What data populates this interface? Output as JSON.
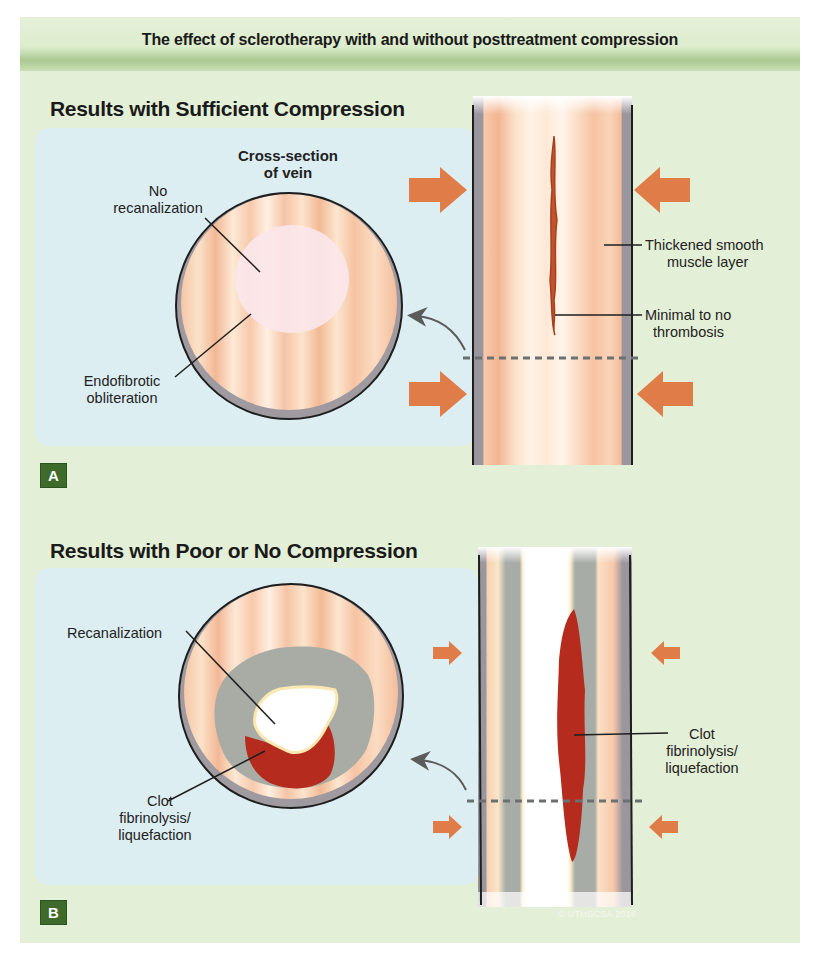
{
  "header": {
    "title": "The effect of sclerotherapy with and without posttreatment compression"
  },
  "colors": {
    "panel_bg": "#e4efd7",
    "header_band": "#a9c98f",
    "blue_box": "#ddeef2",
    "badge_bg": "#3e6b2c",
    "arrow": "#e07c48",
    "clot": "#b8291c",
    "vessel_wall": "#9e9aa0",
    "muscle_stripes": "#f4c3a3",
    "thrombus_gray": "#a7aca4"
  },
  "panels": [
    {
      "id": "A",
      "badge": "A",
      "title": "Results with Sufficient Compression",
      "cross_section_label": [
        "Cross-section",
        "of vein"
      ],
      "circle_labels": [
        {
          "name": "no-recanalization",
          "lines": [
            "No",
            "recanalization"
          ]
        },
        {
          "name": "endofibrotic-obliteration",
          "lines": [
            "Endofibrotic",
            "obliteration"
          ]
        }
      ],
      "vein_labels": [
        {
          "name": "thickened-smooth-muscle-layer",
          "lines": [
            "Thickened smooth",
            "muscle layer"
          ]
        },
        {
          "name": "minimal-thrombosis",
          "lines": [
            "Minimal to no",
            "thrombosis"
          ]
        }
      ],
      "compression": "large arrows"
    },
    {
      "id": "B",
      "badge": "B",
      "title": "Results with Poor or No Compression",
      "circle_labels": [
        {
          "name": "recanalization",
          "lines": [
            "Recanalization"
          ]
        },
        {
          "name": "clot-fibrinolysis",
          "lines": [
            "Clot",
            "fibrinolysis/",
            "liquefaction"
          ]
        }
      ],
      "vein_labels": [
        {
          "name": "clot-fibrinolysis-vein",
          "lines": [
            "Clot",
            "fibrinolysis/",
            "liquefaction"
          ]
        }
      ],
      "compression": "small arrows"
    }
  ],
  "copyright": "© UTHSCSA 2016"
}
